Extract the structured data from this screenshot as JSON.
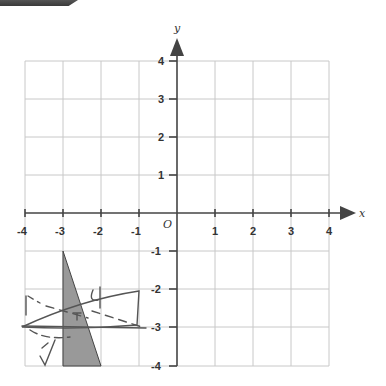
{
  "diagram": {
    "axes": {
      "x_label": "x",
      "y_label": "y",
      "origin_label": "O",
      "x_ticks": [
        "-4",
        "-3",
        "-2",
        "-1",
        "1",
        "2",
        "3",
        "4"
      ],
      "y_ticks": [
        "4",
        "3",
        "2",
        "1",
        "-1",
        "-2",
        "-3",
        "-4"
      ],
      "x_range": [
        -4,
        4
      ],
      "y_range": [
        -4,
        4
      ]
    },
    "shaded_triangle": {
      "vertices": [
        [
          -3,
          -1
        ],
        [
          -3,
          -4
        ],
        [
          -2,
          -4
        ]
      ],
      "fill": "#999999"
    },
    "handwritten_triangle": {
      "vertices": [
        [
          -4,
          -3
        ],
        [
          -1,
          -2
        ],
        [
          -1,
          -3
        ]
      ],
      "note": "pencil sketch"
    },
    "colors": {
      "grid": "#c8c8c8",
      "axis": "#444444",
      "pencil": "#555555"
    }
  }
}
